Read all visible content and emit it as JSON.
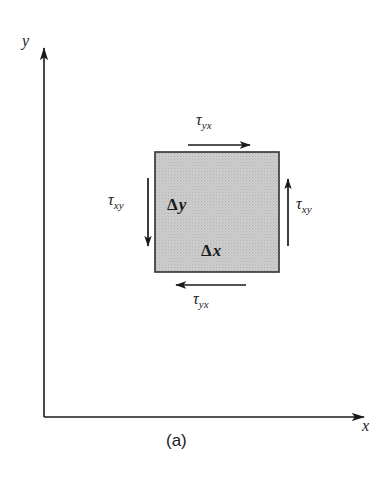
{
  "figure": {
    "caption": "(a)",
    "background_color": "#ffffff",
    "ink_color": "#1a1a1a",
    "element_fill_color": "#cccccc",
    "element_edge_color": "#3a3a3a",
    "axes": {
      "y_axis_label": "y",
      "x_axis_label": "x",
      "origin": {
        "x": 44,
        "y": 417
      },
      "y_axis_top": 45,
      "x_axis_right": 368
    },
    "element": {
      "name": "stress-element",
      "left": 155,
      "top": 152,
      "width": 124,
      "height": 120,
      "width_label": {
        "symbol": "Δ",
        "variable": "x"
      },
      "height_label": {
        "symbol": "Δ",
        "variable": "y"
      }
    },
    "stress_arrows": [
      {
        "id": "top",
        "symbol": "τ",
        "subscript": "yx",
        "direction": "right",
        "face": "top",
        "x1": 188,
        "y1": 145,
        "x2": 250,
        "y2": 145
      },
      {
        "id": "left",
        "symbol": "τ",
        "subscript": "xy",
        "direction": "down",
        "face": "left",
        "x1": 148,
        "y1": 178,
        "x2": 148,
        "y2": 246
      },
      {
        "id": "right",
        "symbol": "τ",
        "subscript": "xy",
        "direction": "up",
        "face": "right",
        "x1": 288,
        "y1": 246,
        "x2": 288,
        "y2": 179
      },
      {
        "id": "bottom",
        "symbol": "τ",
        "subscript": "yx",
        "direction": "left",
        "face": "bottom",
        "x1": 246,
        "y1": 285,
        "x2": 176,
        "y2": 285
      }
    ]
  },
  "labels": {
    "tau_top": {
      "symbol": "τ",
      "sub": "yx"
    },
    "tau_left": {
      "symbol": "τ",
      "sub": "xy"
    },
    "tau_right": {
      "symbol": "τ",
      "sub": "xy"
    },
    "tau_bottom": {
      "symbol": "τ",
      "sub": "yx"
    },
    "delta_y": {
      "symbol": "Δ",
      "var": "y"
    },
    "delta_x": {
      "symbol": "Δ",
      "var": "x"
    },
    "axis_y": "y",
    "axis_x": "x",
    "caption": "(a)"
  }
}
